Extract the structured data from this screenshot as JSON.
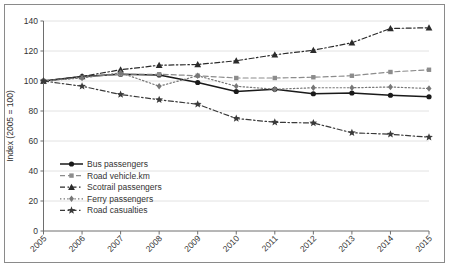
{
  "chart_data": {
    "type": "line",
    "title": "",
    "subtitle": "",
    "xlabel": "",
    "ylabel": "Index (2005 = 100)",
    "categories": [
      "2005",
      "2006",
      "2007",
      "2008",
      "2009",
      "2010",
      "2011",
      "2012",
      "2013",
      "2014",
      "2015"
    ],
    "x": [
      2005,
      2006,
      2007,
      2008,
      2009,
      2010,
      2011,
      2012,
      2013,
      2014,
      2015
    ],
    "xlim": [
      2005,
      2015
    ],
    "ylim": [
      0,
      140
    ],
    "yticks": [
      0,
      20,
      40,
      60,
      80,
      100,
      120,
      140
    ],
    "ytick_labels": [
      "0",
      "20",
      "40",
      "60",
      "80",
      "100",
      "120",
      "140"
    ],
    "grid": true,
    "grid_axis": "y",
    "legend_position": "inside-lower-left",
    "xtick_rotation": -45,
    "series": [
      {
        "name": "Bus passengers",
        "values": [
          100,
          103,
          104.5,
          104,
          99,
          93,
          94.5,
          91.5,
          92,
          90.5,
          89.5
        ],
        "color": "#1a1a1a",
        "line_style": "solid",
        "marker": "circle"
      },
      {
        "name": "Road vehicle.km",
        "values": [
          100,
          102.5,
          104.5,
          104.5,
          103.5,
          102,
          102,
          102.5,
          103.5,
          106,
          107.5
        ],
        "color": "#8c8c8c",
        "line_style": "dashed",
        "marker": "square"
      },
      {
        "name": "Scotrail passengers",
        "values": [
          100,
          103,
          107.5,
          110.5,
          111,
          113.5,
          117.5,
          120.5,
          125.5,
          135,
          135.5
        ],
        "color": "#2b2b2b",
        "line_style": "dashdot",
        "marker": "triangle"
      },
      {
        "name": "Ferry passengers",
        "values": [
          100,
          102,
          105.5,
          96.5,
          103.5,
          96.5,
          94.5,
          95.5,
          95.5,
          96,
          95
        ],
        "color": "#777777",
        "line_style": "dotted",
        "marker": "diamond"
      },
      {
        "name": "Road casualties",
        "values": [
          100,
          96.5,
          91,
          87.5,
          84.5,
          75,
          72.5,
          72,
          65.5,
          64.5,
          62.5
        ],
        "color": "#3a3a3a",
        "line_style": "dashdot",
        "marker": "star"
      }
    ],
    "legend": [
      "Bus passengers",
      "Road vehicle.km",
      "Scotrail passengers",
      "Ferry passengers",
      "Road casualties"
    ]
  },
  "colors": {
    "background": "#ffffff",
    "frame": "#8a8a8a",
    "axis": "#6e6e6e",
    "grid": "#e2e2e2",
    "text": "#333333"
  }
}
